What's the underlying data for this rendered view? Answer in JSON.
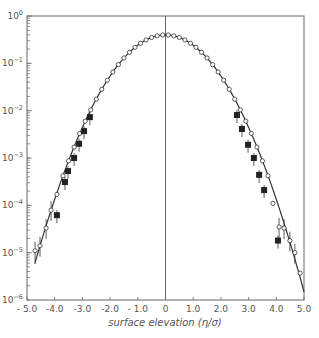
{
  "chart_data": {
    "type": "scatter",
    "title": "",
    "xlabel": "surface elevation (η/σ)",
    "ylabel": "",
    "xlim": [
      -5.0,
      5.0
    ],
    "ylim": [
      1e-06,
      1.0
    ],
    "yscale": "log",
    "grid": false,
    "legend": null,
    "x_ticks": [
      -5.0,
      -4.0,
      -3.0,
      -2.0,
      -1.0,
      0,
      1.0,
      2.0,
      3.0,
      4.0,
      5.0
    ],
    "x_tick_labels": [
      "- 5.0",
      "-4.0",
      "-3.0",
      "-2.0",
      "- 1.0",
      "0",
      "1.0",
      "2.0",
      "3.0",
      "4.0",
      "5.0"
    ],
    "y_ticks": [
      1,
      0.1,
      0.01,
      0.001,
      0.0001,
      1e-05,
      1e-06
    ],
    "y_tick_labels": [
      "10^0",
      "10^-1",
      "10^-2",
      "10^-3",
      "10^-4",
      "10^-5",
      "10^-6"
    ],
    "annotations": [
      "vertical reference line at x = 0"
    ],
    "series": [
      {
        "name": "Gaussian curve",
        "kind": "line",
        "formula": "exp(-x^2/2)/sqrt(2*pi)",
        "x_range": [
          -4.72,
          5.0
        ]
      },
      {
        "name": "open circles",
        "kind": "open-circle",
        "x": [
          -4.71,
          -4.53,
          -4.31,
          -4.13,
          -3.92,
          -3.7,
          -3.5,
          -3.3,
          -3.1,
          -2.9,
          -2.7,
          -2.5,
          -2.3,
          -2.1,
          -1.9,
          -1.7,
          -1.5,
          -1.3,
          -1.1,
          -0.9,
          -0.7,
          -0.5,
          -0.3,
          -0.1,
          0.1,
          0.3,
          0.5,
          0.7,
          0.9,
          1.1,
          1.3,
          1.5,
          1.7,
          1.9,
          2.1,
          2.3,
          2.5,
          2.7,
          2.9,
          3.1,
          3.3,
          3.5,
          3.7,
          3.88,
          4.1,
          4.28,
          4.49,
          4.67,
          4.86
        ],
        "y": [
          1.1e-05,
          1.4e-05,
          3.3e-05,
          7.9e-05,
          0.00017,
          0.00042,
          0.00087,
          0.0017,
          0.0033,
          0.006,
          0.0104,
          0.0175,
          0.0283,
          0.044,
          0.0656,
          0.094,
          0.13,
          0.171,
          0.218,
          0.266,
          0.312,
          0.352,
          0.381,
          0.397,
          0.397,
          0.381,
          0.352,
          0.312,
          0.266,
          0.218,
          0.171,
          0.13,
          0.094,
          0.0656,
          0.044,
          0.0283,
          0.0175,
          0.0104,
          0.006,
          0.0033,
          0.0017,
          0.00087,
          0.00042,
          0.00011,
          3.5e-05,
          3.3e-05,
          1.8e-05,
          1e-05,
          3.7e-06
        ],
        "error_bars_at_x": [
          -4.71,
          -4.53,
          -4.31,
          -4.13,
          4.1,
          4.28,
          4.49,
          4.67
        ]
      },
      {
        "name": "filled squares",
        "kind": "filled-square",
        "x": [
          -3.92,
          -3.63,
          -3.52,
          -3.3,
          -3.12,
          -2.94,
          -2.73,
          2.58,
          2.76,
          2.98,
          3.19,
          3.38,
          3.56,
          4.06
        ],
        "y": [
          6.2e-05,
          0.00031,
          0.00053,
          0.001,
          0.002,
          0.0037,
          0.0073,
          0.0081,
          0.0041,
          0.0019,
          0.001,
          0.00044,
          0.00021,
          1.8e-05
        ]
      }
    ],
    "colors": {
      "ink": "#333333",
      "axis": "#666666",
      "background": "#ffffff"
    }
  }
}
